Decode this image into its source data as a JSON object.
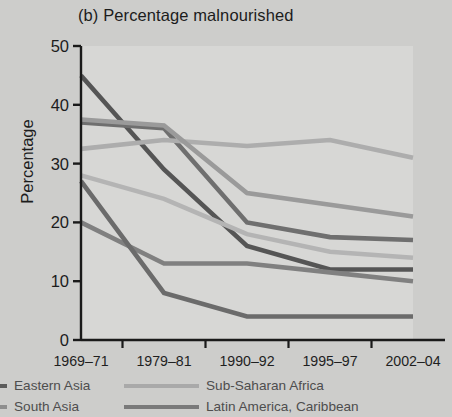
{
  "title": "(b) Percentage malnourished",
  "axis": {
    "ylabel": "Percentage",
    "yticks": [
      "0",
      "10",
      "20",
      "30",
      "40",
      "50"
    ],
    "xticks": [
      "1969–71",
      "1979–81",
      "1990–92",
      "1995–97",
      "2002–04"
    ]
  },
  "legend": {
    "items": [
      {
        "label": "Eastern Asia",
        "color": "#5b5b5b",
        "swatch": "short",
        "col": 1,
        "row": 1
      },
      {
        "label": "South Asia",
        "color": "#8e8e8e",
        "swatch": "short",
        "col": 1,
        "row": 2
      },
      {
        "label": "Sub-Saharan Africa",
        "color": "#a9a9a9",
        "swatch": "long",
        "col": 2,
        "row": 1
      },
      {
        "label": "Latin America, Caribbean",
        "color": "#7a7a7a",
        "swatch": "long",
        "col": 2,
        "row": 2
      }
    ]
  },
  "chart_data": {
    "type": "line",
    "title": "(b) Percentage malnourished",
    "xlabel": "",
    "ylabel": "Percentage",
    "ylim": [
      0,
      50
    ],
    "yticks": [
      0,
      10,
      20,
      30,
      40,
      50
    ],
    "grid": false,
    "legend_position": "below",
    "categories": [
      "1969–71",
      "1979–81",
      "1990–92",
      "1995–97",
      "2002–04"
    ],
    "series": [
      {
        "name": "Eastern Asia",
        "color": "#555555",
        "width": 4.6,
        "values": [
          45,
          29,
          16,
          12,
          12
        ]
      },
      {
        "name": "South Asia",
        "color": "#6f6f6f",
        "width": 4.6,
        "values": [
          37,
          36,
          20,
          17.5,
          17
        ]
      },
      {
        "name": "Sub-Saharan Africa",
        "color": "#adadad",
        "width": 4.6,
        "values": [
          32.5,
          34,
          33,
          34,
          31
        ]
      },
      {
        "name": "Developing world",
        "color": "#9a9a9a",
        "width": 4.6,
        "values": [
          37.5,
          36.5,
          25,
          23,
          21
        ]
      },
      {
        "name": "Near East, North Africa",
        "color": "#b4b4b4",
        "width": 4.6,
        "values": [
          28,
          24,
          18,
          15,
          14
        ]
      },
      {
        "name": "Latin America, Caribbean",
        "color": "#808080",
        "width": 4.6,
        "values": [
          20,
          13,
          13,
          11.5,
          10
        ]
      },
      {
        "name": "East Asia low",
        "color": "#6b6b6b",
        "width": 4.6,
        "values": [
          27,
          8,
          4,
          4,
          4
        ]
      }
    ]
  }
}
